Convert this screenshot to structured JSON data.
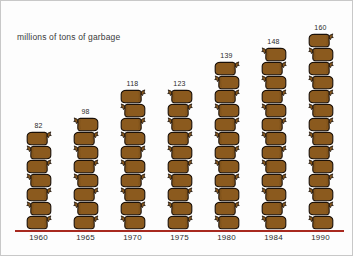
{
  "chart_data": {
    "type": "bar",
    "subtype": "pictograph",
    "title": "millions of tons of garbage",
    "xlabel": "",
    "ylabel": "millions of tons of garbage",
    "categories": [
      "1960",
      "1965",
      "1970",
      "1975",
      "1980",
      "1984",
      "1990"
    ],
    "values": [
      82,
      98,
      118,
      123,
      139,
      148,
      160
    ],
    "value_labels": [
      "82",
      "98",
      "118",
      "123",
      "139",
      "148",
      "160"
    ],
    "icon_counts": [
      7,
      8,
      10,
      10,
      12,
      13,
      14
    ],
    "icon": "garbage-bag-icon",
    "icon_unit_value": 12,
    "ylim": [
      0,
      170
    ],
    "grid": false,
    "legend": false,
    "baseline_color": "#a8291f",
    "icon_fill_color": "#8B5A1E",
    "icon_outline_color": "#1a1008",
    "background_color": "#fdfdfd",
    "title_color": "#3a3a3a"
  },
  "axis": {
    "years": [
      "1960",
      "1965",
      "1970",
      "1975",
      "1980",
      "1984",
      "1990"
    ]
  },
  "columns": [
    {
      "year": "1960",
      "value": "82",
      "bags": 7
    },
    {
      "year": "1965",
      "value": "98",
      "bags": 8
    },
    {
      "year": "1970",
      "value": "118",
      "bags": 10
    },
    {
      "year": "1975",
      "value": "123",
      "bags": 10
    },
    {
      "year": "1980",
      "value": "139",
      "bags": 12
    },
    {
      "year": "1984",
      "value": "148",
      "bags": 13
    },
    {
      "year": "1990",
      "value": "160",
      "bags": 14
    }
  ]
}
